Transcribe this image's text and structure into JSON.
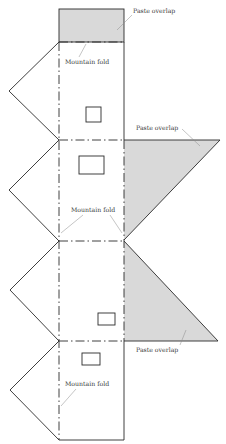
{
  "diagram": {
    "type": "paper-model-template",
    "colors": {
      "line": "#2a2a2a",
      "fill": "#d9d9d9",
      "leader": "#8a8a8a",
      "background": "#ffffff"
    },
    "labels": {
      "paste_overlap_top": "Paste overlap",
      "mountain_fold_top": "Mountain fold",
      "paste_overlap_right_upper": "Paste overlap",
      "mountain_fold_middle": "Mountain fold",
      "paste_overlap_right_lower": "Paste overlap",
      "mountain_fold_bottom": "Mountain fold"
    },
    "panels": [
      {
        "name": "top-paste-flap",
        "shaded": true
      },
      {
        "name": "wall-1",
        "windows": 1
      },
      {
        "name": "wall-2",
        "windows": 1
      },
      {
        "name": "wall-3",
        "windows": 1
      },
      {
        "name": "wall-4",
        "windows": 1
      }
    ]
  }
}
